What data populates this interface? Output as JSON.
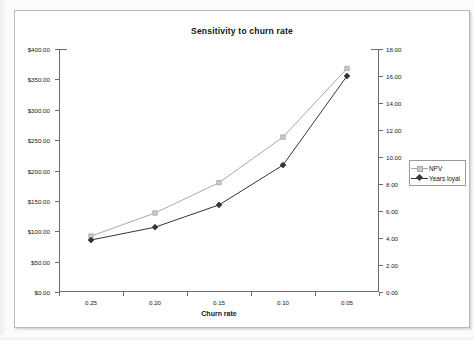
{
  "chart_data": {
    "type": "line",
    "title": "Sensitivity to churn rate",
    "xlabel": "Churn rate",
    "ylabel": "",
    "categories": [
      "0.25",
      "0.20",
      "0.15",
      "0.10",
      "0.05"
    ],
    "x": [
      0.25,
      0.2,
      0.15,
      0.1,
      0.05
    ],
    "grid": false,
    "legend_position": "right",
    "axes": {
      "left": {
        "label": "",
        "min": 0,
        "max": 400,
        "step": 50,
        "tick_labels": [
          "$0.00",
          "$50.00",
          "$100.00",
          "$150.00",
          "$200.00",
          "$250.00",
          "$300.00",
          "$350.00",
          "$400.00"
        ],
        "tick_values": [
          0,
          50,
          100,
          150,
          200,
          250,
          300,
          350,
          400
        ],
        "series": "NPV"
      },
      "right": {
        "label": "",
        "min": 0,
        "max": 18,
        "step": 2,
        "tick_labels": [
          "0.00",
          "2.00",
          "4.00",
          "6.00",
          "8.00",
          "10.00",
          "12.00",
          "14.00",
          "16.00",
          "18.00"
        ],
        "tick_values": [
          0,
          2,
          4,
          6,
          8,
          10,
          12,
          14,
          16,
          18
        ],
        "series": "Years loyal"
      },
      "x": {
        "tick_labels": [
          "0.25",
          "0.20",
          "0.15",
          "0.10",
          "0.05"
        ]
      }
    },
    "series": [
      {
        "name": "NPV",
        "axis": "left",
        "color": "#a8a8a8",
        "marker": "square",
        "values": [
          92,
          130,
          180,
          255,
          368
        ],
        "value_labels": [
          "$92.00",
          "$130.00",
          "$180.00",
          "$255.00",
          "$368.00"
        ]
      },
      {
        "name": "Years loyal",
        "axis": "right",
        "color": "#363636",
        "marker": "diamond",
        "values": [
          3.85,
          4.8,
          6.45,
          9.4,
          16.0
        ],
        "value_labels": [
          "3.85",
          "4.80",
          "6.45",
          "9.40",
          "16.00"
        ]
      }
    ],
    "legend": [
      {
        "label": "NPV",
        "color": "#a8a8a8",
        "marker": "square"
      },
      {
        "label": "Years loyal",
        "color": "#363636",
        "marker": "diamond"
      }
    ]
  }
}
